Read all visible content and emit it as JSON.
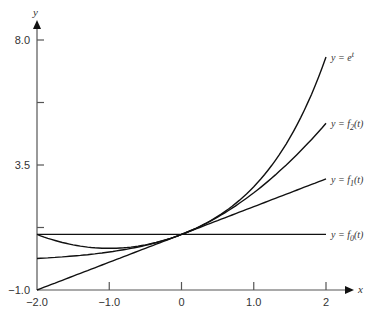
{
  "chart_data": {
    "type": "line",
    "title": "",
    "xlabel": "x",
    "ylabel": "y",
    "xlim": [
      -2.0,
      2.0
    ],
    "ylim": [
      -1.0,
      8.0
    ],
    "x_ticks": [
      "-2.0",
      "-1.0",
      "0",
      "1.0",
      "2"
    ],
    "y_ticks": [
      "-1.0",
      "3.5",
      "8.0"
    ],
    "grid": false,
    "legend": "inline labels at right end of curves",
    "series": [
      {
        "name": "y = e^t",
        "label_main": "y = e",
        "label_sup": "t",
        "x": [
          -2,
          -1,
          0,
          1,
          2
        ],
        "values": [
          0.135,
          0.368,
          1.0,
          2.718,
          7.389
        ]
      },
      {
        "name": "y = f2(t)",
        "label_main": "y = f",
        "label_sub": "2",
        "label_tail": "(t)",
        "x": [
          -2,
          -1,
          0,
          1,
          2
        ],
        "values": [
          1.0,
          0.5,
          1.0,
          2.5,
          5.0
        ]
      },
      {
        "name": "y = f1(t)",
        "label_main": "y = f",
        "label_sub": "1",
        "label_tail": "(t)",
        "x": [
          -2,
          -1,
          0,
          1,
          2
        ],
        "values": [
          -1.0,
          0.0,
          1.0,
          2.0,
          3.0
        ]
      },
      {
        "name": "y = f0(t)",
        "label_main": "y = f",
        "label_sub": "0",
        "label_tail": "(t)",
        "x": [
          -2,
          -1,
          0,
          1,
          2
        ],
        "values": [
          1.0,
          1.0,
          1.0,
          1.0,
          1.0
        ]
      }
    ]
  }
}
